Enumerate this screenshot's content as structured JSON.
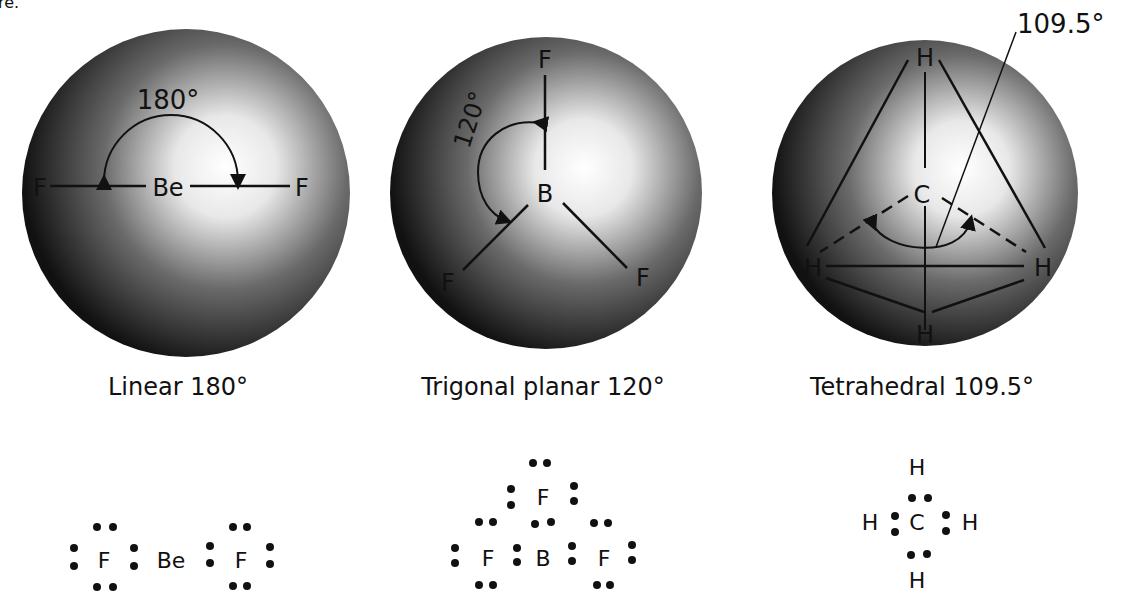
{
  "top_fragment": "re.",
  "panels": [
    {
      "shape": "Linear",
      "angle": "180°",
      "caption": "Linear 180°",
      "center_atom": "Be",
      "outer_atoms": [
        "F",
        "F"
      ],
      "angle_label": "180°",
      "lewis": {
        "atoms": [
          "F",
          "Be",
          "F"
        ]
      }
    },
    {
      "shape": "Trigonal planar",
      "angle": "120°",
      "caption": "Trigonal planar 120°",
      "center_atom": "B",
      "outer_atoms": [
        "F",
        "F",
        "F"
      ],
      "angle_label": "120°",
      "lewis": {
        "atoms": [
          "F",
          "F",
          "B",
          "F"
        ]
      }
    },
    {
      "shape": "Tetrahedral",
      "angle": "109.5°",
      "caption": "Tetrahedral 109.5°",
      "center_atom": "C",
      "outer_atoms": [
        "H",
        "H",
        "H",
        "H"
      ],
      "angle_label": "109.5°",
      "lewis": {
        "atoms": [
          "H",
          "H",
          "C",
          "H",
          "H"
        ]
      }
    }
  ]
}
